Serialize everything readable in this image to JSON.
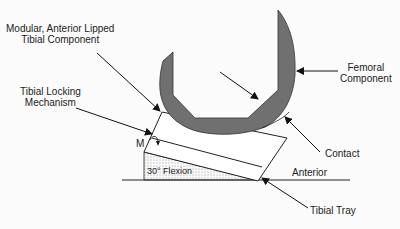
{
  "diagram": {
    "type": "knee-prosthesis-schematic",
    "labels": {
      "tibial_component": [
        "Modular, Anterior Lipped",
        "Tibial Component"
      ],
      "locking_mechanism": [
        "Tibial Locking",
        "Mechanism"
      ],
      "femoral_component": [
        "Femoral",
        "Component"
      ],
      "contact": "Contact",
      "anterior": "Anterior",
      "tibial_tray": "Tibial Tray",
      "m_marker": "M",
      "flexion": "30° Flexion"
    },
    "colors": {
      "femoral_fill": "#707070",
      "line": "#1a1a1a",
      "background": "#fbfbfb"
    }
  }
}
